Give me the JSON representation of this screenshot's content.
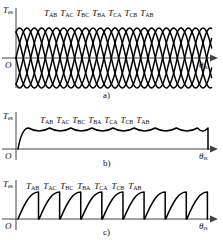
{
  "figure": {
    "axis": {
      "y_label_main": "T",
      "y_label_sub": "es",
      "x_label_main": "θ",
      "x_label_sub": "rs",
      "origin": "O"
    },
    "colors": {
      "curve": "#000000",
      "axis": "#444444",
      "background": "#ffffff"
    },
    "sequence": [
      {
        "main": "T",
        "sub": "AB"
      },
      {
        "main": "T",
        "sub": "AC"
      },
      {
        "main": "T",
        "sub": "BC"
      },
      {
        "main": "T",
        "sub": "BA"
      },
      {
        "main": "T",
        "sub": "CA"
      },
      {
        "main": "T",
        "sub": "CB"
      },
      {
        "main": "T",
        "sub": "AB"
      }
    ],
    "panels": [
      {
        "id": "a",
        "caption": "a)",
        "description": "overlapping-sinusoidal-torque-curves"
      },
      {
        "id": "b",
        "caption": "b)",
        "description": "scalloped-upper-envelope-torque-ripple"
      },
      {
        "id": "c",
        "caption": "c)",
        "description": "sawtooth-rising-arc-torque"
      }
    ]
  },
  "chart_data": {
    "type": "line",
    "title": "",
    "xlabel": "θrs",
    "ylabel": "Tes",
    "grid": false,
    "legend": "none",
    "panels": [
      {
        "id": "a",
        "caption": "a)",
        "type": "line",
        "description": "Six overlapping sinusoidal phase-pair torque curves crossing the zero axis, forming a lattice of intersections.",
        "annotations": [
          "TAB",
          "TAC",
          "TBC",
          "TBA",
          "TCA",
          "TCB",
          "TAB"
        ],
        "n_curves": 6,
        "period_deg": 120,
        "phase_step_deg": 20,
        "amplitude": 1.0,
        "ylim": [
          -1.0,
          1.0
        ],
        "xlim_deg": [
          0,
          420
        ],
        "zero_axis": true
      },
      {
        "id": "b",
        "caption": "b)",
        "type": "line",
        "description": "Upper envelope of the overlapping curves: a shallow scalloped ripple staying above zero.",
        "annotations": [
          "TAB",
          "TAC",
          "TBC",
          "TBA",
          "TCA",
          "TCB",
          "TAB"
        ],
        "n_scallops": 9,
        "ripple_top": 1.0,
        "ripple_bottom": 0.866,
        "ylim": [
          0,
          1.15
        ],
        "xlim_deg": [
          0,
          420
        ],
        "zero_axis": true
      },
      {
        "id": "c",
        "caption": "c)",
        "type": "line",
        "description": "Sawtooth torque: each interval rises as a concave arc from zero to peak, then drops vertically back to zero.",
        "annotations": [
          "TAB",
          "TAC",
          "TBC",
          "TBA",
          "TCA",
          "TCB",
          "TAB"
        ],
        "n_teeth": 9,
        "peak": 1.0,
        "trough": 0.0,
        "ylim": [
          0,
          1.15
        ],
        "xlim_deg": [
          0,
          420
        ],
        "zero_axis": true
      }
    ]
  }
}
